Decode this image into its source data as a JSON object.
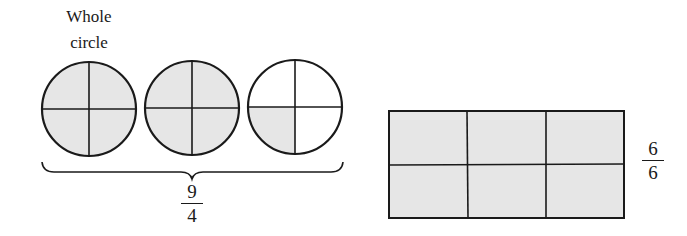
{
  "left_figure": {
    "label_line1": "Whole",
    "label_line2": "circle",
    "circles": [
      {
        "index": 1,
        "parts": 4,
        "shaded_parts": 4
      },
      {
        "index": 2,
        "parts": 4,
        "shaded_parts": 4
      },
      {
        "index": 3,
        "parts": 4,
        "shaded_parts": 1,
        "shaded_quadrant": "bottom-left"
      }
    ],
    "fraction": {
      "numerator": "9",
      "denominator": "4"
    }
  },
  "right_figure": {
    "rectangle": {
      "rows": 2,
      "columns": 3,
      "parts": 6,
      "shaded_parts": 6
    },
    "fraction": {
      "numerator": "6",
      "denominator": "6"
    }
  },
  "colors": {
    "shade": "#e6e6e6",
    "stroke": "#1a1a1a",
    "background": "#ffffff"
  }
}
